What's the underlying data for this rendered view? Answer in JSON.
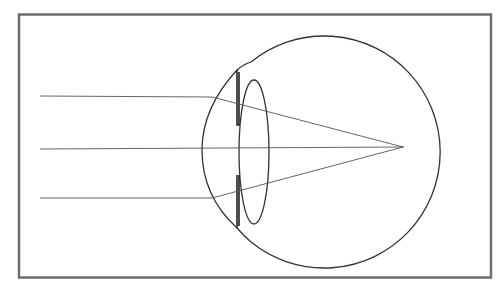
{
  "diagram": {
    "title": "",
    "colors": {
      "border": "#6e6e6e",
      "outline": "#333333",
      "rays": "#555555",
      "background": "#ffffff"
    },
    "elements": {
      "frame": {
        "x": 19,
        "y": 14,
        "width": 472,
        "height": 263
      },
      "eyeball": {
        "cx": 318,
        "cy": 150,
        "r": 116
      },
      "cornea": {
        "description": "front bulge of eye"
      },
      "lens": {
        "cx": 254,
        "cy": 152,
        "rx": 16,
        "ry": 72
      },
      "iris": {
        "x": 237,
        "top_y1": 70,
        "top_y2": 125,
        "bottom_y1": 175,
        "bottom_y2": 228
      },
      "focal_point": {
        "x": 403,
        "y": 147
      },
      "rays": [
        {
          "name": "top-ray",
          "y": 96
        },
        {
          "name": "middle-ray",
          "y": 149
        },
        {
          "name": "bottom-ray",
          "y": 198
        }
      ]
    }
  }
}
